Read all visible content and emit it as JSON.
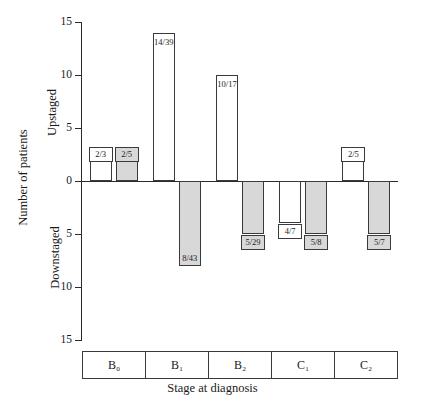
{
  "chart_data": {
    "type": "bar",
    "title": "",
    "xlabel": "Stage at diagnosis",
    "ylabel": "Number of patients",
    "axis_direction_labels": {
      "positive": "Upstaged",
      "negative": "Downstaged"
    },
    "categories": [
      "B₀",
      "B₁",
      "B₂",
      "C₁",
      "C₂"
    ],
    "ylim": [
      -15,
      15
    ],
    "yticks": [
      "15",
      "10",
      "5",
      "0",
      "5",
      "10",
      "15"
    ],
    "ytick_values": [
      15,
      10,
      5,
      0,
      -5,
      -10,
      -15
    ],
    "grid": false,
    "legend": "none",
    "series": [
      {
        "name": "white",
        "fill": "#ffffff",
        "values": [
          2,
          14,
          10,
          -4,
          2
        ],
        "labels": [
          "2/3",
          "14/39",
          "10/17",
          "4/7",
          "2/5"
        ]
      },
      {
        "name": "shaded",
        "fill": "#d8d8d8",
        "values": [
          2,
          -8,
          -5,
          -5,
          -5
        ],
        "labels": [
          "2/5",
          "8/43",
          "5/29",
          "5/8",
          "5/7"
        ]
      }
    ],
    "bars": [
      {
        "category": "B₀",
        "series": "white",
        "value": 2,
        "label": "2/3",
        "fill": "#ffffff"
      },
      {
        "category": "B₀",
        "series": "shaded",
        "value": 2,
        "label": "2/5",
        "fill": "#d8d8d8"
      },
      {
        "category": "B₁",
        "series": "white",
        "value": 14,
        "label": "14/39",
        "fill": "#ffffff"
      },
      {
        "category": "B₁",
        "series": "shaded",
        "value": -8,
        "label": "8/43",
        "fill": "#d8d8d8"
      },
      {
        "category": "B₂",
        "series": "white",
        "value": 10,
        "label": "10/17",
        "fill": "#ffffff"
      },
      {
        "category": "B₂",
        "series": "shaded",
        "value": -5,
        "label": "5/29",
        "fill": "#d8d8d8"
      },
      {
        "category": "C₁",
        "series": "white",
        "value": -4,
        "label": "4/7",
        "fill": "#ffffff"
      },
      {
        "category": "C₁",
        "series": "shaded",
        "value": -5,
        "label": "5/8",
        "fill": "#d8d8d8"
      },
      {
        "category": "C₂",
        "series": "white",
        "value": 2,
        "label": "2/5",
        "fill": "#ffffff"
      },
      {
        "category": "C₂",
        "series": "shaded",
        "value": -5,
        "label": "5/7",
        "fill": "#d8d8d8"
      }
    ],
    "colors": {
      "axis": "#2b2b2b",
      "bar_stroke": "#3a3a3a",
      "bar_white": "#ffffff",
      "bar_shaded": "#d8d8d8",
      "text": "#1a1a1a"
    }
  },
  "ticks": [
    {
      "label": "15"
    },
    {
      "label": "10"
    },
    {
      "label": "5"
    },
    {
      "label": "0"
    },
    {
      "label": "5"
    },
    {
      "label": "10"
    },
    {
      "label": "15"
    }
  ]
}
